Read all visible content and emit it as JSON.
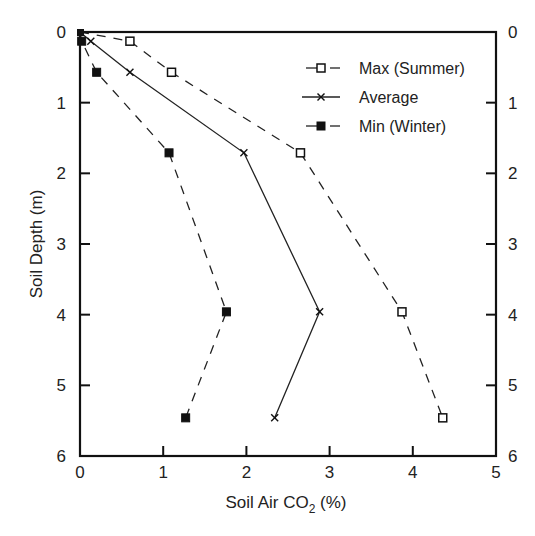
{
  "chart_data": {
    "type": "line",
    "title": "",
    "xlabel": "Soil Air CO2 (%)",
    "xlabel_main": "Soil Air CO",
    "xlabel_sub": "2",
    "xlabel_tail": " (%)",
    "ylabel": "Soil Depth (m)",
    "xlim": [
      0,
      5
    ],
    "ylim": [
      0,
      6
    ],
    "y_inverted": true,
    "x_ticks": [
      "0",
      "1",
      "2",
      "3",
      "4",
      "5"
    ],
    "y_ticks": [
      "0",
      "1",
      "2",
      "3",
      "4",
      "5",
      "6"
    ],
    "y_ticks_right": [
      "0",
      "1",
      "2",
      "3",
      "4",
      "5",
      "6"
    ],
    "grid": false,
    "legend_position": "upper right",
    "series": [
      {
        "name": "Max (Summer)",
        "marker": "open-square",
        "line": "dashed",
        "points": [
          [
            0,
            0
          ],
          [
            0.6,
            0.13
          ],
          [
            1.1,
            0.57
          ],
          [
            2.65,
            1.71
          ],
          [
            3.87,
            3.96
          ],
          [
            4.36,
            5.46
          ]
        ]
      },
      {
        "name": "Average",
        "marker": "x",
        "line": "solid",
        "points": [
          [
            0,
            0
          ],
          [
            0.13,
            0.13
          ],
          [
            0.6,
            0.57
          ],
          [
            1.97,
            1.71
          ],
          [
            2.88,
            3.96
          ],
          [
            2.34,
            5.46
          ]
        ]
      },
      {
        "name": "Min (Winter)",
        "marker": "filled-square",
        "line": "dashed",
        "points": [
          [
            0,
            0
          ],
          [
            0.02,
            0.13
          ],
          [
            0.2,
            0.57
          ],
          [
            1.07,
            1.71
          ],
          [
            1.76,
            3.96
          ],
          [
            1.27,
            5.46
          ]
        ]
      }
    ]
  }
}
